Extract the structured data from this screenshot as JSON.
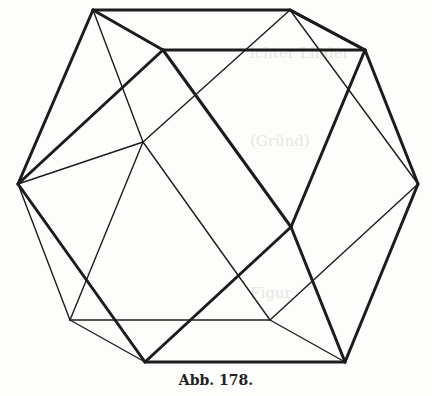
{
  "figure": {
    "caption": "Abb. 178.",
    "stroke_color": "#1c1c1c",
    "background": "#fdfdfb"
  }
}
